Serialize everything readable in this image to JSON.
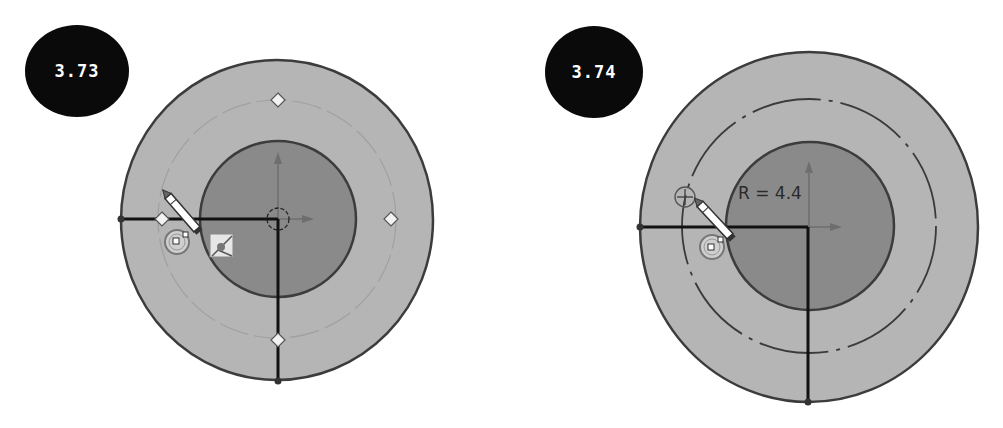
{
  "figures": [
    {
      "step_label": "3.73",
      "badge": {
        "cx": 77,
        "cy": 71,
        "rx": 52,
        "ry": 46
      },
      "outer_circle": {
        "cx": 277,
        "cy": 220,
        "rx": 156,
        "ry": 160
      },
      "reference_circle": {
        "cx": 277,
        "cy": 219,
        "r": 119,
        "style": "faint"
      },
      "inner_circle": {
        "cx": 278,
        "cy": 219,
        "r": 78
      },
      "handles": [
        {
          "x": 278,
          "y": 100
        },
        {
          "x": 391,
          "y": 219
        },
        {
          "x": 278,
          "y": 340
        },
        {
          "x": 162,
          "y": 219
        }
      ],
      "cursor_icons": [
        "pencil-cursor",
        "snap-point-icon",
        "intersection-snap-icon"
      ]
    },
    {
      "step_label": "3.74",
      "badge": {
        "cx": 594,
        "cy": 72,
        "rx": 49,
        "ry": 46
      },
      "outer_circle": {
        "cx": 809,
        "cy": 227,
        "rx": 169,
        "ry": 175
      },
      "reference_circle": {
        "cx": 809,
        "cy": 226,
        "r": 128,
        "style": "dashed"
      },
      "inner_circle": {
        "cx": 810,
        "cy": 226,
        "r": 84
      },
      "dimension_label": "R = 4.4",
      "cursor_icons": [
        "pencil-cursor",
        "snap-point-icon",
        "crosshair-circle-icon"
      ]
    }
  ],
  "colors": {
    "outer_fill": "#b5b5b5",
    "inner_fill": "#8a8a8a",
    "outline": "#3c3c3c",
    "construction_line": "#111111",
    "axis_arrow": "#6e6e6e",
    "badge_bg": "#0a0a0a",
    "badge_text": "#ffffff"
  }
}
